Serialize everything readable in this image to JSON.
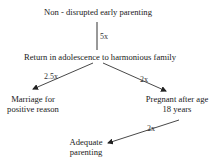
{
  "diagram": {
    "type": "flowchart",
    "nodes": [
      {
        "id": "n1",
        "label": "Non - disrupted early parenting"
      },
      {
        "id": "n2",
        "label": "Return in adolescence to harmonious family"
      },
      {
        "id": "n3",
        "label_line1": "Marriage for",
        "label_line2": "positive reason"
      },
      {
        "id": "n4",
        "label_line1": "Pregnant after age",
        "label_line2": "18 years"
      },
      {
        "id": "n5",
        "label_line1": "Adequate",
        "label_line2": "parenting"
      }
    ],
    "edges": [
      {
        "from": "n1",
        "to": "n2",
        "label": "5x"
      },
      {
        "from": "n2",
        "to": "n3",
        "label": "2.5x"
      },
      {
        "from": "n2",
        "to": "n4",
        "label": "2x"
      },
      {
        "from": "n4",
        "to": "n5",
        "label": "2x"
      }
    ],
    "colors": {
      "line": "#333333",
      "text": "#1a1a1a",
      "background": "#ffffff"
    }
  }
}
